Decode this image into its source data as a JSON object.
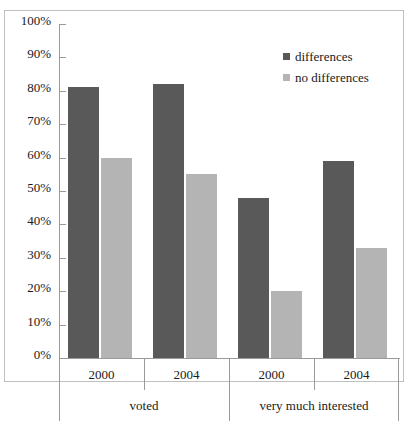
{
  "chart_data": {
    "type": "bar",
    "title": "",
    "subtitle": "",
    "xlabel": "",
    "ylabel": "",
    "ylim": [
      0,
      100
    ],
    "ytick_labels": [
      "100%",
      "90%",
      "80%",
      "70%",
      "60%",
      "50%",
      "40%",
      "30%",
      "20%",
      "10%",
      "0%"
    ],
    "ytick_values": [
      100,
      90,
      80,
      70,
      60,
      50,
      40,
      30,
      20,
      10,
      0
    ],
    "grid": false,
    "legend_position": "top-right",
    "group_labels": [
      "voted",
      "very much interested"
    ],
    "categories": [
      "2000",
      "2004",
      "2000",
      "2004"
    ],
    "groups": [
      {
        "label": "voted",
        "categories": [
          "2000",
          "2004"
        ],
        "values": {
          "differences": [
            81,
            82
          ],
          "no differences": [
            60,
            55
          ]
        }
      },
      {
        "label": "very much interested",
        "categories": [
          "2000",
          "2004"
        ],
        "values": {
          "differences": [
            48,
            59
          ],
          "no differences": [
            20,
            33
          ]
        }
      }
    ],
    "series": [
      {
        "name": "differences",
        "color": "#595959",
        "values": [
          81,
          82,
          48,
          59
        ]
      },
      {
        "name": "no differences",
        "color": "#b4b4b4",
        "values": [
          60,
          55,
          20,
          33
        ]
      }
    ]
  },
  "legend": {
    "items": [
      {
        "label": "differences",
        "color": "#595959"
      },
      {
        "label": "no differences",
        "color": "#b4b4b4"
      }
    ]
  },
  "colors": {
    "series_differences": "#595959",
    "series_no_differences": "#b4b4b4",
    "axis": "#9a9a9a",
    "frame": "#bfbfbf",
    "background": "#ffffff",
    "text": "#1a1a1a"
  }
}
